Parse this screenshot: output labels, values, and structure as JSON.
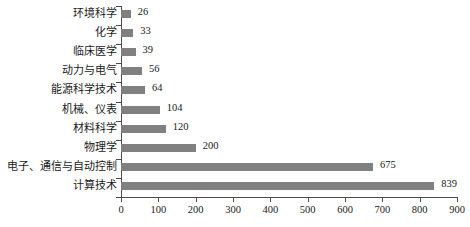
{
  "chart_data": {
    "type": "bar",
    "orientation": "horizontal",
    "title": "",
    "xlabel": "",
    "ylabel": "",
    "xlim": [
      0,
      900
    ],
    "xticks": [
      0,
      100,
      200,
      300,
      400,
      500,
      600,
      700,
      800,
      900
    ],
    "grid": false,
    "legend": null,
    "bar_color": "#808080",
    "axis_color": "#4d4d4d",
    "categories": [
      "环境科学",
      "化学",
      "临床医学",
      "动力与电气",
      "能源科学技术",
      "机械、仪表",
      "材料科学",
      "物理学",
      "电子、通信与自动控制",
      "计算技术"
    ],
    "values": [
      26,
      33,
      39,
      56,
      64,
      104,
      120,
      200,
      675,
      839
    ],
    "value_labels": [
      "26",
      "33",
      "39",
      "56",
      "64",
      "104",
      "120",
      "200",
      "675",
      "839"
    ],
    "xtick_labels": [
      "0",
      "100",
      "200",
      "300",
      "400",
      "500",
      "600",
      "700",
      "800",
      "900"
    ]
  }
}
